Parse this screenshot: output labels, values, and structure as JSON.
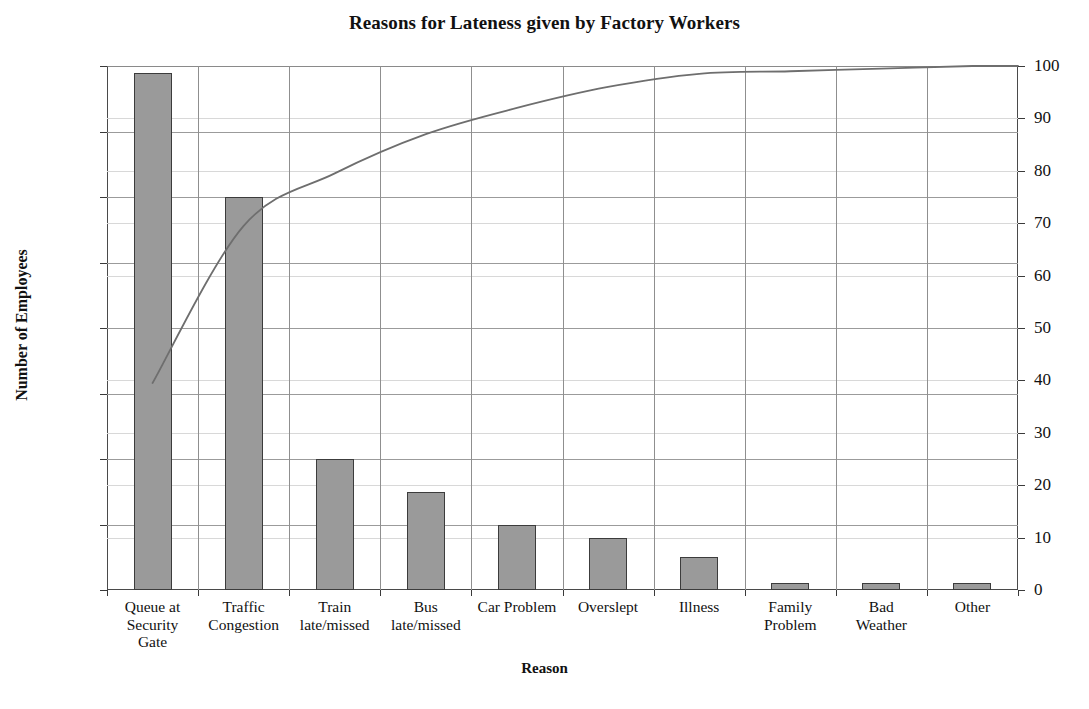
{
  "chart_data": {
    "type": "bar",
    "title": "Reasons for Lateness given by Factory Workers",
    "xlabel": "Reason",
    "ylabel": "Number of Employees",
    "y2label": "",
    "grid": true,
    "legend": "none",
    "categories": [
      "Queue at Security Gate",
      "Traffic Congestion",
      "Train late/missed",
      "Bus late/missed",
      "Car Problem",
      "Overslept",
      "Illness",
      "Family Problem",
      "Bad Weather",
      "Other"
    ],
    "category_lines": [
      [
        "Queue at",
        "Security",
        "Gate"
      ],
      [
        "Traffic",
        "Congestion"
      ],
      [
        "Train",
        "late/missed"
      ],
      [
        "Bus",
        "late/missed"
      ],
      [
        "Car Problem"
      ],
      [
        "Overslept"
      ],
      [
        "Illness"
      ],
      [
        "Family",
        "Problem"
      ],
      [
        "Bad",
        "Weather"
      ],
      [
        "Other"
      ]
    ],
    "values": [
      79,
      60,
      20,
      15,
      10,
      8,
      5,
      1,
      1,
      1
    ],
    "cumulative_percent": [
      39.5,
      69.5,
      79.5,
      87.0,
      92.0,
      96.0,
      98.5,
      99.0,
      99.5,
      100.0
    ],
    "total": 200,
    "ylim": [
      0,
      80
    ],
    "y2lim": [
      0,
      100
    ],
    "yticks": [
      0,
      10,
      20,
      30,
      40,
      50,
      60,
      70,
      80
    ],
    "y2ticks": [
      0,
      10,
      20,
      30,
      40,
      50,
      60,
      70,
      80,
      90,
      100
    ],
    "ytick_labels": [
      "0",
      "10",
      "20",
      "30",
      "40",
      "50",
      "60",
      "70",
      "80"
    ],
    "y2tick_labels": [
      "0",
      "10",
      "20",
      "30",
      "40",
      "50",
      "60",
      "70",
      "80",
      "90",
      "100"
    ],
    "series": [
      {
        "name": "Number of Employees",
        "type": "bar",
        "values": [
          79,
          60,
          20,
          15,
          10,
          8,
          5,
          1,
          1,
          1
        ],
        "color": "#9a9a9a",
        "axis": "left"
      },
      {
        "name": "Cumulative Percentage",
        "type": "line",
        "values": [
          39.5,
          69.5,
          79.5,
          87.0,
          92.0,
          96.0,
          98.5,
          99.0,
          99.5,
          100.0
        ],
        "color": "#6e6e6e",
        "axis": "right"
      }
    ]
  },
  "colors": {
    "bar_fill": "#9a9a9a",
    "bar_border": "#3c3c3c",
    "line": "#6e6e6e",
    "grid_major": "#9b9b9b",
    "grid_minor": "#d8d8d8",
    "axis": "#3a3a3a",
    "text": "#111111",
    "background": "#ffffff"
  }
}
